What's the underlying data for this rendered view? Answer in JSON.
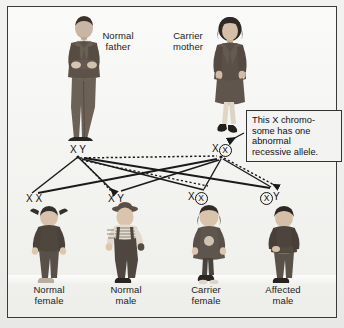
{
  "diagram": {
    "parents": [
      {
        "id": "father",
        "label": "Normal\nfather",
        "genotype_text": "X Y",
        "alleles": [
          "X",
          "Y"
        ],
        "circled": []
      },
      {
        "id": "mother",
        "label": "Carrier\nmother",
        "genotype_text": "X X",
        "alleles": [
          "X",
          "X"
        ],
        "circled": [
          "X2"
        ]
      }
    ],
    "children": [
      {
        "id": "child-1",
        "label": "Normal\nfemale",
        "genotype_text": "X X",
        "alleles": [
          "X",
          "X"
        ],
        "circled": []
      },
      {
        "id": "child-2",
        "label": "Normal\nmale",
        "genotype_text": "X Y",
        "alleles": [
          "X",
          "Y"
        ],
        "circled": []
      },
      {
        "id": "child-3",
        "label": "Carrier\nfemale",
        "genotype_text": "X X",
        "alleles": [
          "X",
          "X"
        ],
        "circled": [
          "X2"
        ]
      },
      {
        "id": "child-4",
        "label": "Affected\nmale",
        "genotype_text": "X Y",
        "alleles": [
          "X",
          "Y"
        ],
        "circled": [
          "X1"
        ]
      }
    ],
    "callout": {
      "text": "This X chromo-some has one abnormal recessive allele.",
      "lines": [
        "This X chromo-",
        "some has one",
        "abnormal",
        "recessive allele."
      ]
    },
    "legend": {
      "solid_line_meaning": "allele contributed by father",
      "dotted_line_meaning": "allele contributed by mother"
    },
    "colors": {
      "frame": "#3a3a3a",
      "background": "#f4f4f2",
      "text": "#111111",
      "line": "#1a1a1a",
      "callout_bg": "#f3f3f1"
    }
  }
}
